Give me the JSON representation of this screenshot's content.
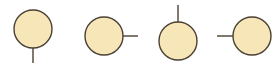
{
  "figure": {
    "type": "diagram",
    "width": 280,
    "height": 70,
    "background_color": "#FFFFFF",
    "style": {
      "node_fill_color": "#F7E6B8",
      "node_stroke_color": "#4A4034",
      "node_stroke_width": 1.4,
      "stem_color": "#4A4034",
      "stem_width": 1.4,
      "node_radius": 19
    },
    "nodes": [
      {
        "id": "node-1",
        "label": "",
        "shape": "circle",
        "direction": "south",
        "direction_symbol": "↓",
        "cx": 33,
        "cy": 29,
        "r": 19,
        "stem": {
          "x1": 33,
          "y1": 48,
          "x2": 33,
          "y2": 63
        }
      },
      {
        "id": "node-2",
        "label": "",
        "shape": "circle",
        "direction": "east",
        "direction_symbol": "→",
        "cx": 104,
        "cy": 36,
        "r": 19,
        "stem": {
          "x1": 123,
          "y1": 36,
          "x2": 138,
          "y2": 36
        }
      },
      {
        "id": "node-3",
        "label": "",
        "shape": "circle",
        "direction": "north",
        "direction_symbol": "↑",
        "cx": 178,
        "cy": 41,
        "r": 19,
        "stem": {
          "x1": 178,
          "y1": 22,
          "x2": 178,
          "y2": 5
        }
      },
      {
        "id": "node-4",
        "label": "",
        "shape": "circle",
        "direction": "west",
        "direction_symbol": "←",
        "cx": 252,
        "cy": 36,
        "r": 19,
        "stem": {
          "x1": 233,
          "y1": 36,
          "x2": 217,
          "y2": 36
        }
      }
    ]
  }
}
